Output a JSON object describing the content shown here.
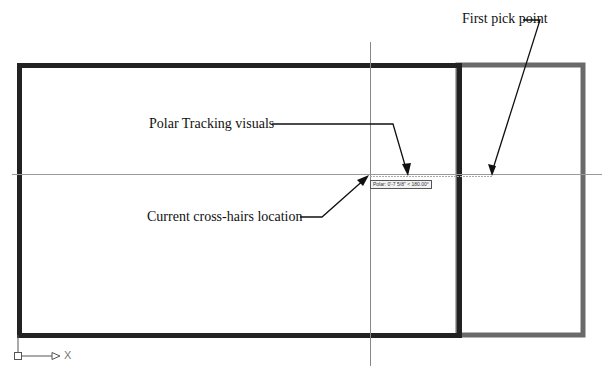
{
  "annotations": {
    "first_pick_point": "First pick point",
    "polar_tracking": "Polar Tracking visuals",
    "crosshairs": "Current cross-hairs location"
  },
  "tooltip": {
    "text": "Polar: 0'-7 5/8\" < 180.00°"
  },
  "ucs": {
    "x_label": "X"
  },
  "colors": {
    "dark_rect": "#222222",
    "gray_rect": "#6a6a6a",
    "crosshair": "#888888"
  }
}
